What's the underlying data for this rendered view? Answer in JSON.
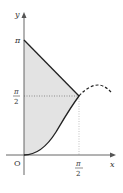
{
  "diagram": {
    "axes": {
      "x_label": "x",
      "y_label": "y",
      "origin_label": "O"
    },
    "ticks": {
      "y_pi": "π",
      "y_half_pi_num": "π",
      "y_half_pi_den": "2",
      "x_half_pi_num": "π",
      "x_half_pi_den": "2"
    },
    "curves": [
      {
        "name": "line",
        "description": "y = π − x, from (0, π) to (π/2, π/2)",
        "style": "solid"
      },
      {
        "name": "lower-curve",
        "description": "curve from origin (0,0) to (π/2, π/2)",
        "style": "solid"
      },
      {
        "name": "continuation",
        "description": "curve continuing beyond x = π/2",
        "style": "dashed"
      }
    ],
    "shaded_region": "region bounded by y-axis, the line, and the lower curve",
    "colors": {
      "axis": "#555555",
      "curve": "#222222",
      "shade": "#e3e3e3",
      "guide": "#888888"
    }
  }
}
